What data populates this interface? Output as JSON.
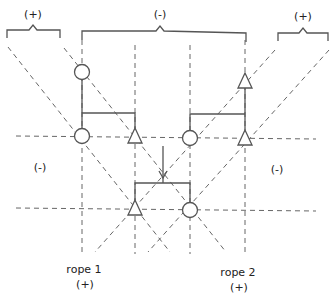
{
  "diagram": {
    "colors": {
      "stroke": "#555555",
      "dash": "#666666",
      "text": "#222222"
    },
    "brackets": [
      {
        "label": "(+)",
        "x1": 7,
        "x2": 60,
        "y": 30,
        "lx": 33,
        "ly": 8
      },
      {
        "label": "(-)",
        "x1": 82,
        "x2": 246,
        "y": 31,
        "lx": 160,
        "ly": 8
      },
      {
        "label": "(+)",
        "x1": 278,
        "x2": 328,
        "y": 33,
        "lx": 303,
        "ly": 10
      }
    ],
    "regions": [
      {
        "label": "(-)",
        "x": 40,
        "y": 160
      },
      {
        "label": "(-)",
        "x": 276,
        "y": 163
      }
    ],
    "ropes": [
      {
        "name": "rope 1",
        "sign": "(+)",
        "x": 85,
        "y": 260
      },
      {
        "name": "rope 2",
        "sign": "(+)",
        "x": 240,
        "y": 263
      }
    ],
    "markers": [
      {
        "type": "circle",
        "x": 82,
        "y": 72
      },
      {
        "type": "circle",
        "x": 82,
        "y": 136
      },
      {
        "type": "triangle",
        "x": 135,
        "y": 136
      },
      {
        "type": "circle",
        "x": 190,
        "y": 138
      },
      {
        "type": "triangle",
        "x": 245,
        "y": 80
      },
      {
        "type": "triangle",
        "x": 245,
        "y": 138
      },
      {
        "type": "triangle",
        "x": 135,
        "y": 208
      },
      {
        "type": "circle",
        "x": 190,
        "y": 210
      }
    ],
    "labels": {
      "bracket_left": "(+)",
      "bracket_middle": "(-)",
      "bracket_right": "(+)",
      "region_left": "(-)",
      "region_right": "(-)",
      "rope1_name": "rope 1",
      "rope1_sign": "(+)",
      "rope2_name": "rope 2",
      "rope2_sign": "(+)"
    }
  }
}
